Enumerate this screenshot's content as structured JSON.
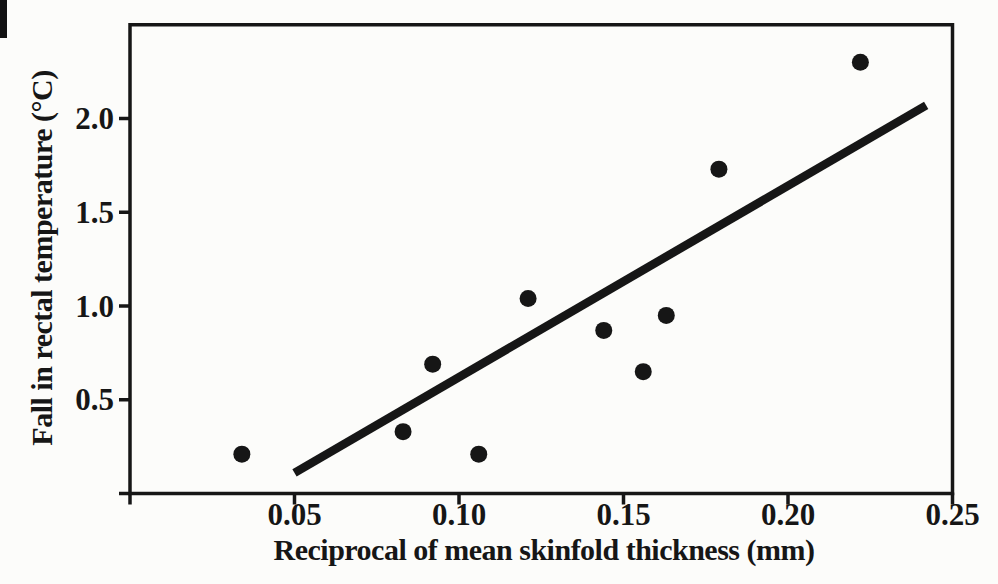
{
  "figure": {
    "background": "#fcfcfa",
    "ink": "#161616"
  },
  "chart_data": {
    "type": "scatter",
    "title": "",
    "xlabel": "Reciprocal of mean skinfold thickness (mm)",
    "ylabel": "Fall in rectal temperature (°C)",
    "xlim": [
      0,
      0.25
    ],
    "ylim": [
      0,
      2.5
    ],
    "grid": false,
    "legend": null,
    "x_ticks": [
      0,
      0.05,
      0.1,
      0.15,
      0.2,
      0.25
    ],
    "x_tick_labels": [
      "",
      "0.05",
      "0.10",
      "0.15",
      "0.20",
      "0.25"
    ],
    "y_ticks": [
      0,
      0.5,
      1.0,
      1.5,
      2.0
    ],
    "y_tick_labels": [
      "",
      "0.5",
      "1.0",
      "1.5",
      "2.0"
    ],
    "points": [
      [
        0.034,
        0.21
      ],
      [
        0.083,
        0.33
      ],
      [
        0.092,
        0.69
      ],
      [
        0.106,
        0.21
      ],
      [
        0.121,
        1.04
      ],
      [
        0.144,
        0.87
      ],
      [
        0.156,
        0.65
      ],
      [
        0.163,
        0.95
      ],
      [
        0.179,
        1.73
      ],
      [
        0.222,
        2.3
      ]
    ],
    "regression_line": {
      "x1": 0.05,
      "y1": 0.11,
      "x2": 0.242,
      "y2": 2.07
    },
    "marker": {
      "shape": "circle",
      "radius_px": 8.5,
      "color": "#161616"
    },
    "line_width_px": 8.5
  }
}
